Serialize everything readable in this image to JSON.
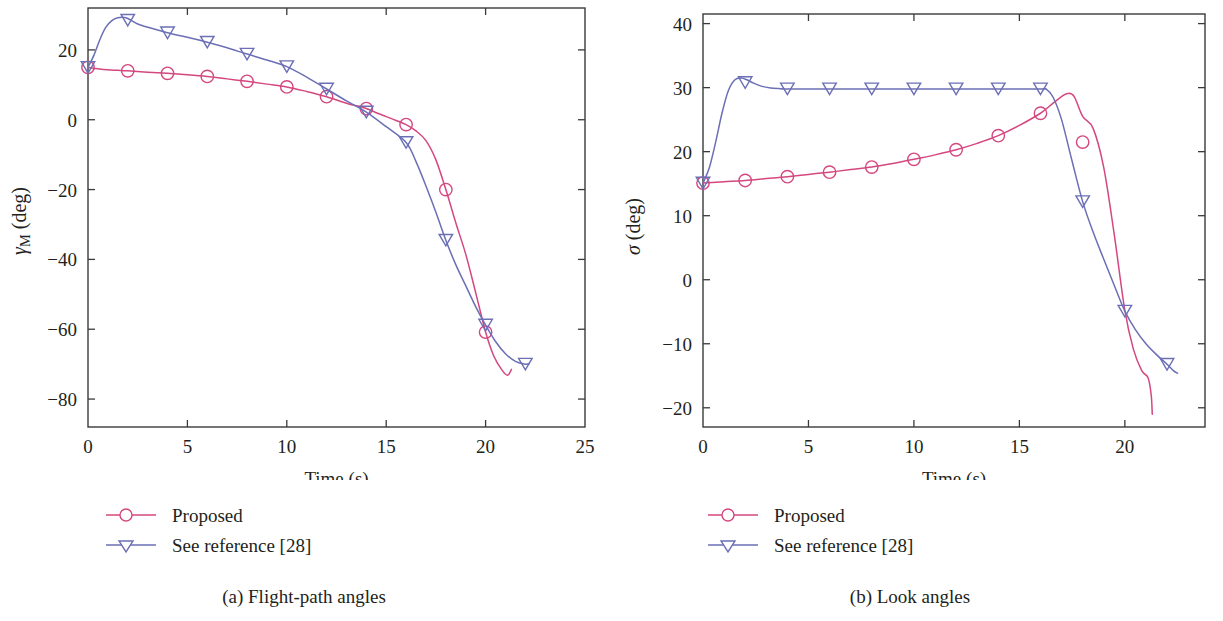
{
  "figure": {
    "panels": [
      {
        "id": "a",
        "caption": "(a) Flight-path angles",
        "xlabel": "Time (s)",
        "ylabel_symbol": "γ",
        "ylabel_sub": "M",
        "ylabel_unit": " (deg)",
        "ylabel_full": "γM (deg)",
        "legend": [
          {
            "label": "Proposed",
            "marker": "circle",
            "color": "#d4477f"
          },
          {
            "label": "See reference [28]",
            "marker": "triangle-down",
            "color": "#6b6fb5"
          }
        ]
      },
      {
        "id": "b",
        "caption": "(b) Look angles",
        "xlabel": "Time (s)",
        "ylabel_symbol": "σ",
        "ylabel_sub": "",
        "ylabel_unit": " (deg)",
        "ylabel_full": "σ (deg)",
        "legend": [
          {
            "label": "Proposed",
            "marker": "circle",
            "color": "#d4477f"
          },
          {
            "label": "See reference [28]",
            "marker": "triangle-down",
            "color": "#6b6fb5"
          }
        ]
      }
    ]
  },
  "chart_data": [
    {
      "type": "line",
      "panel": "a",
      "title": "(a) Flight-path angles",
      "xlabel": "Time (s)",
      "ylabel": "γM (deg)",
      "xlim": [
        0,
        25
      ],
      "ylim": [
        -88,
        32
      ],
      "xticks": [
        0,
        5,
        10,
        15,
        20,
        25
      ],
      "yticks": [
        -80,
        -60,
        -40,
        -20,
        0,
        20
      ],
      "xticklabels": [
        "0",
        "5",
        "10",
        "15",
        "20",
        "25"
      ],
      "yticklabels": [
        "−80",
        "−60",
        "−40",
        "−20",
        "0",
        "20"
      ],
      "grid": false,
      "legend_position": "below-left",
      "series": [
        {
          "name": "Proposed",
          "color": "#d4477f",
          "marker": "circle",
          "marker_x": [
            0,
            2,
            4,
            6,
            8,
            10,
            12,
            14,
            16,
            18,
            20
          ],
          "marker_y": [
            15.0,
            14.0,
            13.3,
            12.4,
            11.0,
            9.4,
            6.6,
            3.2,
            -1.4,
            -20.0,
            -60.8
          ],
          "x": [
            0,
            0.5,
            1,
            1.5,
            2,
            3,
            4,
            5,
            6,
            7,
            8,
            9,
            10,
            11,
            12,
            13,
            13.5,
            14,
            14.5,
            15,
            15.5,
            16,
            16.5,
            17,
            17.5,
            18,
            18.5,
            19,
            19.5,
            20,
            20.4,
            20.8,
            21.1,
            21.3
          ],
          "y": [
            15.0,
            14.6,
            14.3,
            14.15,
            14.0,
            13.6,
            13.3,
            12.9,
            12.4,
            11.7,
            11.0,
            10.2,
            9.4,
            8.1,
            6.6,
            4.7,
            4.0,
            3.2,
            2.0,
            0.9,
            -0.2,
            -1.4,
            -3.2,
            -6.0,
            -11.5,
            -20.0,
            -29.5,
            -38.5,
            -49.5,
            -60.8,
            -67.5,
            -71.5,
            -73.2,
            -71.5
          ]
        },
        {
          "name": "See reference [28]",
          "color": "#6b6fb5",
          "marker": "triangle-down",
          "marker_x": [
            0,
            2,
            4,
            6,
            8,
            10,
            12,
            14,
            16,
            18,
            20,
            22
          ],
          "marker_y": [
            15.0,
            28.5,
            24.9,
            22.2,
            18.8,
            15.2,
            8.8,
            2.2,
            -6.5,
            -34.5,
            -58.8,
            -70.0
          ],
          "x": [
            0,
            0.3,
            0.6,
            0.9,
            1.2,
            1.5,
            1.8,
            2,
            2.5,
            3,
            4,
            5,
            6,
            7,
            8,
            9,
            10,
            11,
            12,
            13,
            14,
            15,
            16,
            16.5,
            17,
            17.5,
            18,
            18.5,
            19,
            19.5,
            20,
            20.5,
            21,
            21.5,
            22,
            22.2
          ],
          "y": [
            15.0,
            18.5,
            23.0,
            26.5,
            28.4,
            29.2,
            29.3,
            29.0,
            27.4,
            26.5,
            24.9,
            23.6,
            22.2,
            20.6,
            18.8,
            17.1,
            15.2,
            12.2,
            8.8,
            5.4,
            2.2,
            -2.0,
            -6.5,
            -12.0,
            -19.0,
            -26.5,
            -34.5,
            -41.5,
            -47.5,
            -53.5,
            -58.8,
            -63.5,
            -67.0,
            -69.2,
            -70.0,
            -69.8
          ]
        }
      ]
    },
    {
      "type": "line",
      "panel": "b",
      "title": "(b) Look angles",
      "xlabel": "Time (s)",
      "ylabel": "σ (deg)",
      "xlim": [
        0,
        23.8
      ],
      "ylim": [
        -23,
        41.5
      ],
      "xticks": [
        0,
        5,
        10,
        15,
        20
      ],
      "yticks": [
        -20,
        -10,
        0,
        10,
        20,
        30,
        40
      ],
      "xticklabels": [
        "0",
        "5",
        "10",
        "15",
        "20"
      ],
      "yticklabels": [
        "−20",
        "−10",
        "0",
        "10",
        "20",
        "30",
        "40"
      ],
      "grid": false,
      "legend_position": "below-left",
      "series": [
        {
          "name": "Proposed",
          "color": "#d4477f",
          "marker": "circle",
          "marker_x": [
            0,
            2,
            4,
            6,
            8,
            10,
            12,
            14,
            16,
            18
          ],
          "marker_y": [
            15.1,
            15.5,
            16.1,
            16.8,
            17.6,
            18.8,
            20.3,
            22.5,
            26.0,
            21.5
          ],
          "x": [
            0,
            1,
            2,
            3,
            4,
            5,
            6,
            7,
            8,
            9,
            10,
            11,
            12,
            13,
            14,
            15,
            16,
            16.5,
            17,
            17.3,
            17.6,
            18,
            18.5,
            19,
            19.5,
            20,
            20.4,
            20.8,
            21.1,
            21.25,
            21.3
          ],
          "y": [
            15.1,
            15.3,
            15.5,
            15.8,
            16.1,
            16.45,
            16.8,
            17.2,
            17.6,
            18.15,
            18.8,
            19.5,
            20.3,
            21.3,
            22.5,
            24.1,
            26.0,
            27.3,
            28.6,
            29.1,
            28.6,
            25.5,
            23.6,
            17.5,
            7.0,
            -4.8,
            -10.8,
            -14.2,
            -15.3,
            -18.0,
            -21.0
          ]
        },
        {
          "name": "See reference [28]",
          "color": "#6b6fb5",
          "marker": "triangle-down",
          "marker_x": [
            0,
            2,
            4,
            6,
            8,
            10,
            12,
            14,
            16,
            18,
            20,
            22
          ],
          "marker_y": [
            15.1,
            30.8,
            29.8,
            29.8,
            29.8,
            29.8,
            29.8,
            29.8,
            29.8,
            12.2,
            -4.9,
            -13.2
          ],
          "x": [
            0,
            0.3,
            0.6,
            0.9,
            1.2,
            1.5,
            1.8,
            2.1,
            2.4,
            2.8,
            3.2,
            3.6,
            4,
            6,
            8,
            10,
            12,
            14,
            16,
            16.3,
            16.6,
            17,
            17.5,
            18,
            18.5,
            19,
            19.5,
            20,
            20.5,
            21,
            21.5,
            22,
            22.3,
            22.5
          ],
          "y": [
            15.1,
            17.5,
            21.5,
            26.0,
            29.5,
            31.2,
            31.5,
            31.2,
            30.7,
            30.2,
            29.95,
            29.85,
            29.8,
            29.8,
            29.8,
            29.8,
            29.8,
            29.8,
            29.8,
            29.7,
            28.5,
            25.0,
            18.5,
            12.2,
            7.4,
            3.2,
            -0.9,
            -4.9,
            -7.8,
            -10.0,
            -11.7,
            -13.2,
            -14.2,
            -14.6
          ]
        }
      ]
    }
  ]
}
